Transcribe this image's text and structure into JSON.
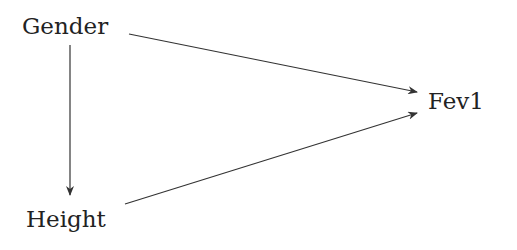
{
  "diagram": {
    "type": "directed-acyclic-graph",
    "nodes": [
      {
        "id": "gender",
        "label": "Gender"
      },
      {
        "id": "height",
        "label": "Height"
      },
      {
        "id": "fev1",
        "label": "Fev1"
      }
    ],
    "edges": [
      {
        "from": "gender",
        "to": "height"
      },
      {
        "from": "gender",
        "to": "fev1"
      },
      {
        "from": "height",
        "to": "fev1"
      }
    ],
    "colors": {
      "line": "#333333",
      "text": "#222222",
      "background": "#ffffff"
    }
  }
}
